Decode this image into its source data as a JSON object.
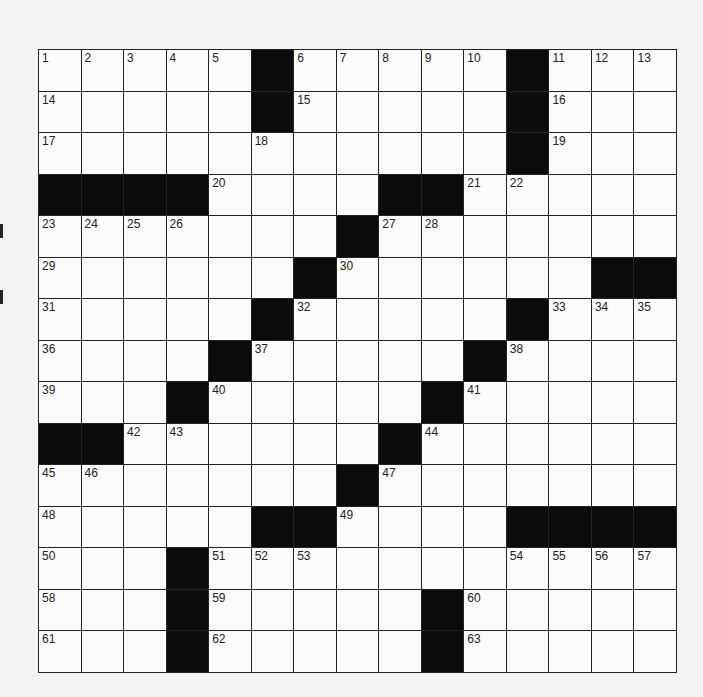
{
  "puzzle": {
    "size": 15,
    "layout": [
      "1,2,3,4,5,#,6,7,8,9,10,#,11,12,13",
      "14,,,,,#,15,,,,,#,16,,",
      "17,,,,,18,,,,,,#,19,,",
      "#,#,#,#,20,,,,#,#,21,22,,,",
      "23,24,25,26,,,,#,27,28,,,,,",
      "29,,,,,,#,30,,,,,,#,#",
      "31,,,,,#,32,,,,,#,33,34,35",
      "36,,,,#,37,,,,,#,38,,,",
      "39,,,#,40,,,,,#,41,,,,",
      "#,#,42,43,,,,,#,44,,,,,",
      "45,46,,,,,,#,47,,,,,,",
      "48,,,,,#,#,49,,,,#,#,#,#",
      "50,,,#,51,52,53,,,,,54,55,56,57",
      "58,,,#,59,,,,,#,60,,,,",
      "61,,,#,62,,,,,#,63,,,,"
    ],
    "letters": {}
  },
  "colors": {
    "paper": "#f4f3f1",
    "cell": "#fbfbfa",
    "block": "#0b0b0b",
    "line": "#222222"
  }
}
